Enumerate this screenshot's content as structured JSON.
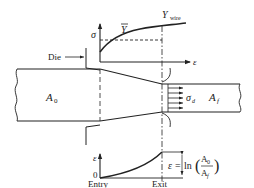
{
  "figure": {
    "type": "wire-drawing-diagram",
    "colors": {
      "ink": "#222222",
      "background": "#ffffff"
    }
  },
  "labels": {
    "die": "Die",
    "initial_area": "A",
    "initial_area_sub": "0",
    "final_area": "A",
    "final_area_sub": "f",
    "drawing_stress": "σ",
    "drawing_stress_sub": "d",
    "entry": "Entry",
    "exit": "Exit"
  },
  "stress_strain_chart": {
    "y_axis_label": "σ",
    "x_axis_label": "ε",
    "mean_flow_stress_label": "Y",
    "mean_flow_stress_bar": "‾",
    "wire_flow_stress_label": "Y",
    "wire_flow_stress_sub": "wire"
  },
  "strain_chart": {
    "y_axis_label": "ε",
    "origin_label": "0",
    "equation_lhs": "ε = ln",
    "equation_num": "A",
    "equation_num_sub": "0",
    "equation_den": "A",
    "equation_den_sub": "f"
  }
}
